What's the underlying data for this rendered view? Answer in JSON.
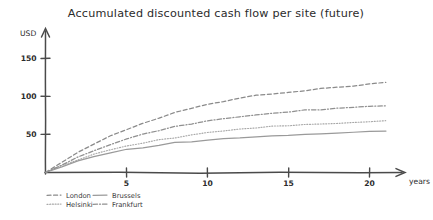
{
  "chart_data": {
    "type": "line",
    "title": "Accumulated discounted cash flow per site (future)",
    "xlabel": "years",
    "ylabel": "USD",
    "xlim": [
      0,
      22
    ],
    "ylim": [
      0,
      160
    ],
    "xticks": [
      5,
      10,
      15,
      20
    ],
    "yticks": [
      50,
      100,
      150
    ],
    "grid": false,
    "legend_position": "bottom-left",
    "x": [
      0,
      1,
      2,
      3,
      4,
      5,
      6,
      7,
      8,
      9,
      10,
      11,
      12,
      13,
      14,
      15,
      16,
      17,
      18,
      19,
      20,
      21
    ],
    "series": [
      {
        "name": "London",
        "style": "dashed",
        "color": "#8a8a8a",
        "values": [
          0,
          14,
          27,
          38,
          48,
          57,
          65,
          72,
          79,
          85,
          90,
          94,
          98,
          101,
          104,
          106,
          108,
          110,
          112,
          114,
          116,
          118
        ]
      },
      {
        "name": "Helsinki",
        "style": "dotted",
        "color": "#a8a8a8",
        "values": [
          0,
          9,
          17,
          24,
          30,
          35,
          39,
          43,
          46,
          49,
          52,
          55,
          57,
          59,
          61,
          62,
          63,
          64,
          65,
          66,
          67,
          68
        ]
      },
      {
        "name": "Brussels",
        "style": "solid",
        "color": "#9a9a9a",
        "values": [
          0,
          8,
          15,
          21,
          26,
          30,
          33,
          36,
          39,
          41,
          43,
          45,
          46,
          47,
          48,
          49,
          50,
          51,
          52,
          53,
          54,
          54
        ]
      },
      {
        "name": "Frankfurt",
        "style": "dashdot",
        "color": "#909090",
        "values": [
          0,
          10,
          20,
          29,
          37,
          44,
          50,
          55,
          60,
          64,
          68,
          71,
          74,
          76,
          78,
          80,
          82,
          83,
          85,
          86,
          87,
          88
        ]
      }
    ]
  },
  "legend": {
    "entries": [
      {
        "label": "London"
      },
      {
        "label": "Brussels"
      },
      {
        "label": "Helsinki"
      },
      {
        "label": "Frankfurt"
      }
    ]
  },
  "axes": {
    "y_axis_caption": "USD",
    "x_axis_caption": "years"
  }
}
